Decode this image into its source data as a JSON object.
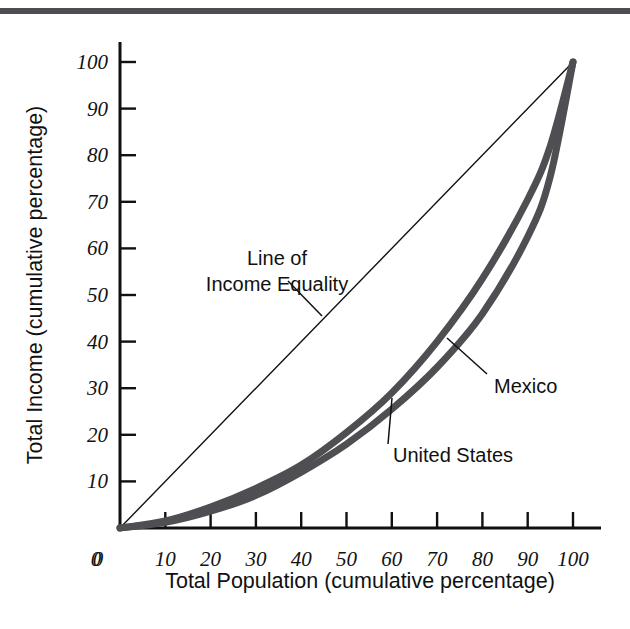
{
  "figure": {
    "background": "#ffffff",
    "rule_color": "#4e4e52",
    "ink_color": "#111111"
  },
  "chart_data": {
    "type": "line",
    "title": "",
    "xlabel": "Total Population (cumulative percentage)",
    "ylabel": "Total Income (cumulative percentage)",
    "xlim": [
      0,
      105
    ],
    "ylim": [
      0,
      105
    ],
    "xticks": [
      0,
      10,
      20,
      30,
      40,
      50,
      60,
      70,
      80,
      90,
      100
    ],
    "yticks": [
      0,
      10,
      20,
      30,
      40,
      50,
      60,
      70,
      80,
      90,
      100
    ],
    "xticklabels": [
      "0",
      "10",
      "20",
      "30",
      "40",
      "50",
      "60",
      "70",
      "80",
      "90",
      "100"
    ],
    "yticklabels": [
      "0",
      "10",
      "20",
      "30",
      "40",
      "50",
      "60",
      "70",
      "80",
      "90",
      "100"
    ],
    "grid": false,
    "legend_position": "inline-annotations",
    "x": [
      0,
      10,
      20,
      30,
      40,
      50,
      60,
      70,
      80,
      90,
      95,
      100
    ],
    "series": [
      {
        "name": "Line of Income Equality",
        "style": "thin-diagonal",
        "color": "#111111",
        "width": 1.4,
        "values": [
          0,
          10,
          20,
          30,
          40,
          50,
          60,
          70,
          80,
          90,
          95,
          100
        ]
      },
      {
        "name": "United States",
        "style": "thick-lorenz",
        "color": "#4f4f53",
        "width": 7,
        "values": [
          0,
          1.5,
          4.5,
          8.5,
          13.5,
          20.5,
          29.0,
          40.0,
          53.5,
          70.5,
          82.0,
          100
        ]
      },
      {
        "name": "Mexico",
        "style": "thick-lorenz",
        "color": "#4f4f53",
        "width": 7,
        "values": [
          0,
          1.2,
          3.6,
          7.0,
          12.0,
          18.0,
          25.5,
          34.5,
          46.0,
          62.5,
          75.5,
          100
        ]
      }
    ],
    "annotations": [
      {
        "id": "line-of-income-equality",
        "lines": [
          "Line of",
          "Income Equality"
        ],
        "text": "Line of Income Equality",
        "text_anchor": "middle",
        "text_x": 277,
        "text_y_first": 265,
        "line_height": 26,
        "leader": {
          "x1": 288,
          "y1": 281,
          "x2": 322,
          "y2": 316
        }
      },
      {
        "id": "mexico",
        "lines": [
          "Mexico"
        ],
        "text": "Mexico",
        "text_anchor": "start",
        "text_x": 494,
        "text_y_first": 393,
        "line_height": 26,
        "leader": {
          "x1": 487,
          "y1": 374,
          "x2": 447,
          "y2": 338
        }
      },
      {
        "id": "united-states",
        "lines": [
          "United States"
        ],
        "text": "United States",
        "text_anchor": "start",
        "text_x": 393,
        "text_y_first": 462,
        "line_height": 26,
        "leader": {
          "x1": 388,
          "y1": 444,
          "x2": 392,
          "y2": 398
        }
      }
    ]
  },
  "axis_titles": {
    "x": "Total Population (cumulative percentage)",
    "y": "Total Income (cumulative percentage)"
  }
}
